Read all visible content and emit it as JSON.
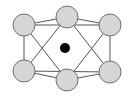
{
  "diagram": {
    "width": 128,
    "height": 97,
    "background": "#ffffff",
    "colors": {
      "node_fill": "#d6d6d6",
      "node_stroke": "#6e6e6e",
      "edge_stroke": "#555555",
      "center_fill": "#000000"
    },
    "node_radius": 11,
    "nodes": [
      {
        "id": "top-left",
        "x": 24,
        "y": 25
      },
      {
        "id": "top-middle",
        "x": 67,
        "y": 17
      },
      {
        "id": "top-right",
        "x": 110,
        "y": 25
      },
      {
        "id": "bottom-left",
        "x": 24,
        "y": 71
      },
      {
        "id": "bottom-middle",
        "x": 67,
        "y": 80
      },
      {
        "id": "bottom-right",
        "x": 110,
        "y": 72
      }
    ],
    "center_dot": {
      "x": 65,
      "y": 48,
      "r": 5
    },
    "edges": [
      [
        "top-left",
        "top-middle"
      ],
      [
        "top-middle",
        "top-right"
      ],
      [
        "top-left",
        "top-right"
      ],
      [
        "bottom-left",
        "bottom-middle"
      ],
      [
        "bottom-middle",
        "bottom-right"
      ],
      [
        "bottom-left",
        "bottom-right"
      ],
      [
        "top-left",
        "bottom-left"
      ],
      [
        "top-right",
        "bottom-right"
      ],
      [
        "top-left",
        "bottom-middle"
      ],
      [
        "top-middle",
        "bottom-left"
      ],
      [
        "top-middle",
        "bottom-right"
      ],
      [
        "top-right",
        "bottom-middle"
      ]
    ]
  }
}
